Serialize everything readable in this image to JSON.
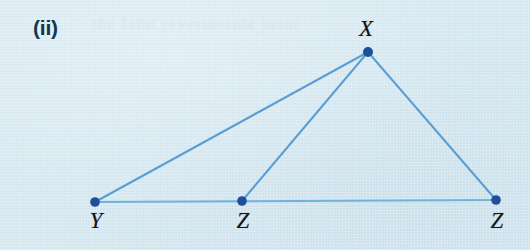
{
  "figure": {
    "part_label": "(ii)",
    "background_color": "#d4e7f0",
    "line_color": "#5a9ed4",
    "base_line_color": "#6fb3dd",
    "vertex_dot_color": "#1f4e9c",
    "label_color": "#15151a",
    "part_label_color": "#14344f"
  },
  "vertices": [
    {
      "name": "X",
      "label": "X",
      "x": 368,
      "y": 52,
      "label_x": 366,
      "label_y": 16,
      "dot_r": 5.0
    },
    {
      "name": "Y",
      "label": "Y",
      "x": 95,
      "y": 202,
      "label_x": 96,
      "label_y": 208,
      "dot_r": 4.8
    },
    {
      "name": "Z1",
      "label": "Z",
      "x": 242,
      "y": 201,
      "label_x": 243,
      "label_y": 208,
      "dot_r": 4.8
    },
    {
      "name": "Z2",
      "label": "Z",
      "x": 496,
      "y": 200,
      "label_x": 497,
      "label_y": 208,
      "dot_r": 4.8
    }
  ],
  "segments": [
    {
      "name": "segment-Y-X",
      "from": "Y",
      "to": "X",
      "width": 2.0,
      "color": "#5a9ed4"
    },
    {
      "name": "segment-Z1-X",
      "from": "Z1",
      "to": "X",
      "width": 2.0,
      "color": "#5a9ed4"
    },
    {
      "name": "segment-X-Z2",
      "from": "X",
      "to": "Z2",
      "width": 2.0,
      "color": "#5a9ed4"
    },
    {
      "name": "segment-Y-Z2-base",
      "from": "Y",
      "to": "Z2",
      "width": 1.9,
      "color": "#6fb3dd"
    }
  ],
  "bleed_through_text": "the faint reverse-side print"
}
